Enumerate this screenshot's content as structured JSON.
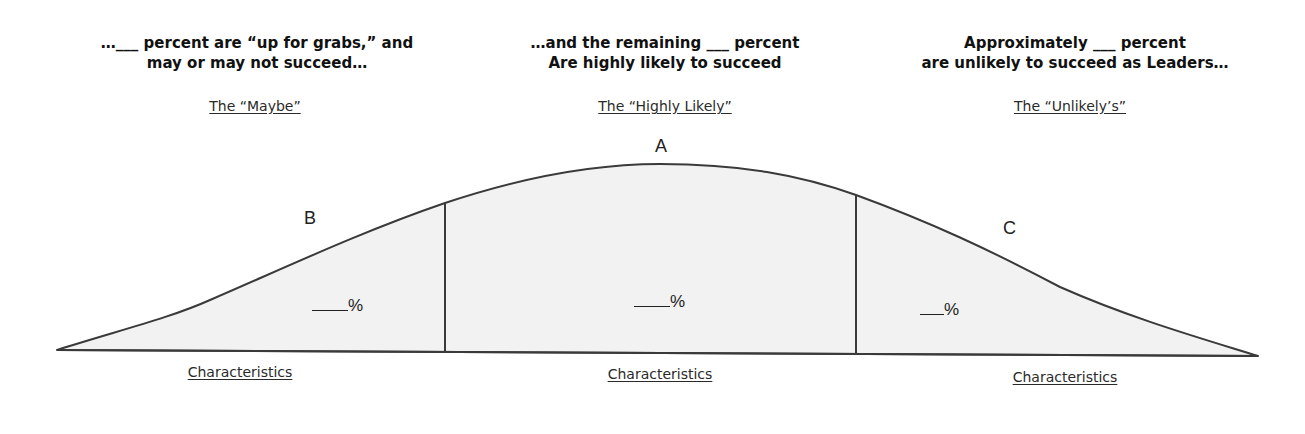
{
  "sections": {
    "maybe": {
      "header_lines": [
        "…___ percent are “up for grabs,” and",
        "may or may not succeed…"
      ],
      "category": "The “Maybe”",
      "letter": "B",
      "percent": "%",
      "characteristics": "Characteristics"
    },
    "highly_likely": {
      "header_lines": [
        "…and the remaining ___ percent",
        "Are highly likely to succeed"
      ],
      "category": "The “Highly Likely”",
      "letter": "A",
      "percent": "%",
      "characteristics": "Characteristics"
    },
    "unlikely": {
      "header_lines": [
        "Approximately ___ percent",
        "are unlikely to succeed as Leaders…"
      ],
      "category": "The “Unlikely’s”",
      "letter": "C",
      "percent": "%",
      "characteristics": "Characteristics"
    }
  },
  "colors": {
    "curve_fill": "#f2f2f2",
    "curve_stroke": "#3a3a3a",
    "text": "#111111"
  }
}
